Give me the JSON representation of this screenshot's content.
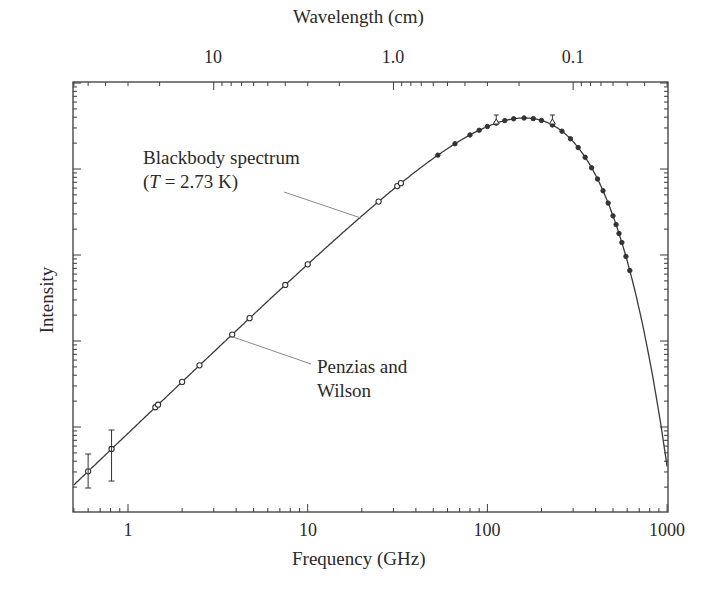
{
  "chart_data": {
    "type": "scatter",
    "title": "",
    "xlabel": "Frequency (GHz)",
    "ylabel": "Intensity",
    "top_xlabel": "Wavelength (cm)",
    "xscale": "log",
    "yscale": "log",
    "xlim": [
      0.5,
      1000
    ],
    "x_ticks": [
      "1",
      "10",
      "100",
      "1000"
    ],
    "top_x_ticks": [
      "10",
      "1.0",
      "0.1"
    ],
    "y_ticks": [],
    "grid": false,
    "legend": null,
    "annotations": [
      {
        "text_line1": "Blackbody spectrum",
        "text_line2_prefix": "(",
        "text_line2_var": "T",
        "text_line2_rest": " = 2.73 K)"
      },
      {
        "text_line1": "Penzias and",
        "text_line2": "Wilson"
      }
    ],
    "series": [
      {
        "name": "Blackbody spectrum (T = 2.73 K)",
        "type": "line",
        "temperature_K": 2.73
      },
      {
        "name": "Measurements",
        "type": "scatter",
        "x_GHz": [
          0.6,
          0.81,
          1.42,
          1.47,
          2.0,
          2.5,
          3.8,
          4.75,
          7.5,
          10,
          24.8,
          31.5,
          33,
          53,
          66,
          80,
          90,
          100,
          112,
          125,
          140,
          160,
          180,
          200,
          230,
          260,
          290,
          320,
          350,
          380,
          410,
          440,
          470,
          500,
          520,
          540,
          560,
          590,
          620
        ],
        "y_decades": [
          0.52,
          0.75,
          1.18,
          1.15,
          1.45,
          1.66,
          2.04,
          2.23,
          2.59,
          2.83,
          3.52,
          3.69,
          3.71,
          3.98,
          4.1,
          4.16,
          4.2,
          4.28,
          4.31,
          4.33,
          4.34,
          4.35,
          4.35,
          4.33,
          4.3,
          4.22,
          4.12,
          4.01,
          3.9,
          3.78,
          3.64,
          3.5,
          3.38,
          3.28,
          3.18,
          3.08,
          2.98,
          2.84,
          2.68
        ]
      }
    ],
    "y_decade_note": "Intensity axis is logarithmic with unlabeled decades; y_decades measured above bottom axis (1 decade ≈ 86 px)"
  },
  "labels": {
    "top_title": "Wavelength (cm)",
    "x_title": "Frequency (GHz)",
    "y_title": "Intensity",
    "bb_line1": "Blackbody spectrum",
    "bb_open": "(",
    "bb_var": "T",
    "bb_rest": " = 2.73 K)",
    "pw_line1": "Penzias and",
    "pw_line2": "Wilson"
  },
  "ticks": {
    "x": [
      {
        "label": "1",
        "x": 128
      },
      {
        "label": "10",
        "x": 308
      },
      {
        "label": "100",
        "x": 487
      },
      {
        "label": "1000",
        "x": 667
      }
    ],
    "top": [
      {
        "label": "10",
        "x": 213
      },
      {
        "label": "1.0",
        "x": 393
      },
      {
        "label": "0.1",
        "x": 573
      }
    ]
  },
  "colors": {
    "axis": "#3a3a3a",
    "curve": "#3a3a3a",
    "leader": "#8a8a8a",
    "marker": "#333333"
  }
}
